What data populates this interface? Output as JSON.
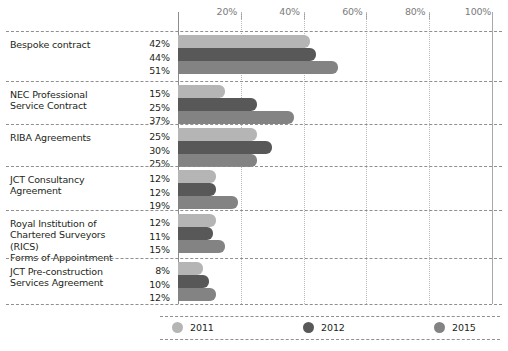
{
  "chart_data": {
    "type": "bar",
    "orientation": "horizontal",
    "title": "",
    "subtitle": "",
    "xlabel": "",
    "ylabel": "",
    "xlim": [
      0,
      100
    ],
    "grid": true,
    "legend_position": "bottom",
    "xticks": [
      {
        "value": 0,
        "label": ""
      },
      {
        "value": 20,
        "label": "20%"
      },
      {
        "value": 40,
        "label": "40%"
      },
      {
        "value": 60,
        "label": "60%"
      },
      {
        "value": 80,
        "label": "80%"
      },
      {
        "value": 100,
        "label": "100%"
      }
    ],
    "categories": [
      "Bespoke contract",
      "NEC Professional Service Contract",
      "RIBA Agreements",
      "JCT Consultancy Agreement",
      "Royal Institution of Chartered Surveyors (RICS) Forms of Appointment",
      "JCT Pre-construction Services Agreement"
    ],
    "category_lines": [
      [
        "Bespoke contract"
      ],
      [
        "NEC Professional",
        "Service Contract"
      ],
      [
        "RIBA Agreements"
      ],
      [
        "JCT Consultancy",
        "Agreement"
      ],
      [
        "Royal Institution of",
        "Chartered Surveyors (RICS)",
        "Forms of Appointment"
      ],
      [
        "JCT Pre-construction",
        "Services Agreement"
      ]
    ],
    "series": [
      {
        "name": "2011",
        "color": "#b5b5b5",
        "values": [
          42,
          15,
          25,
          12,
          12,
          8
        ],
        "labels": [
          "42%",
          "15%",
          "25%",
          "12%",
          "12%",
          "8%"
        ]
      },
      {
        "name": "2012",
        "color": "#585858",
        "values": [
          44,
          25,
          30,
          12,
          11,
          10
        ],
        "labels": [
          "44%",
          "25%",
          "30%",
          "12%",
          "11%",
          "10%"
        ]
      },
      {
        "name": "2015",
        "color": "#838383",
        "values": [
          51,
          37,
          25,
          19,
          15,
          12
        ],
        "labels": [
          "51%",
          "37%",
          "25%",
          "19%",
          "15%",
          "12%"
        ]
      }
    ]
  },
  "legend": {
    "items": [
      {
        "label": "2011",
        "color": "#b5b5b5"
      },
      {
        "label": "2012",
        "color": "#585858"
      },
      {
        "label": "2015",
        "color": "#838383"
      }
    ]
  }
}
